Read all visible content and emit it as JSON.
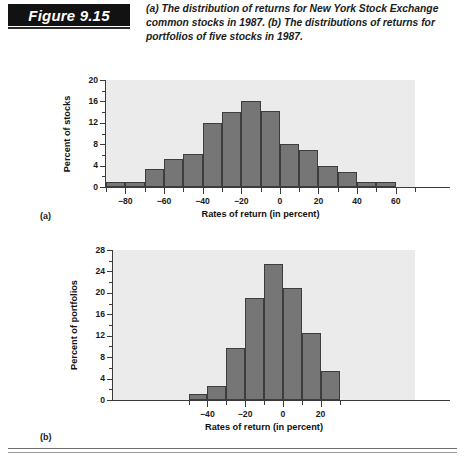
{
  "header": {
    "figure_label": "Figure 9.15",
    "caption": "(a) The distribution of returns for New York Stock Exchange common stocks in 1987. (b) The distributions of returns for portfolios of five stocks in 1987."
  },
  "panels": {
    "a_letter": "(a)",
    "b_letter": "(b)"
  },
  "chart_data": [
    {
      "id": "chart-a",
      "type": "bar",
      "title": "",
      "xlabel": "Rates of return (in percent)",
      "ylabel": "Percent of stocks",
      "xlim": [
        -90,
        70
      ],
      "ylim": [
        0,
        20
      ],
      "bin_width": 10,
      "grid": false,
      "legend": "none",
      "xticks": [
        -90,
        -80,
        -70,
        -60,
        -50,
        -40,
        -30,
        -20,
        -10,
        0,
        10,
        20,
        30,
        40,
        50,
        60,
        70
      ],
      "xtick_labels": [
        "",
        "−80",
        "",
        "−60",
        "",
        "−40",
        "",
        "−20",
        "",
        "0",
        "",
        "20",
        "",
        "40",
        "",
        "60",
        ""
      ],
      "yticks": [
        0,
        2,
        4,
        6,
        8,
        10,
        12,
        14,
        16,
        18,
        20
      ],
      "ytick_labels": [
        "0",
        "",
        "4",
        "",
        "8",
        "",
        "12",
        "",
        "16",
        "",
        "20"
      ],
      "bin_starts": [
        -90,
        -80,
        -70,
        -60,
        -50,
        -40,
        -30,
        -20,
        -10,
        0,
        10,
        20,
        30,
        40,
        50,
        60
      ],
      "categories": [
        "−90 to −80",
        "−80 to −70",
        "−70 to −60",
        "−60 to −50",
        "−50 to −40",
        "−40 to −30",
        "−30 to −20",
        "−20 to −10",
        "−10 to 0",
        "0 to 10",
        "10 to 20",
        "20 to 30",
        "30 to 40",
        "40 to 50",
        "50 to 60",
        "60 to 70"
      ],
      "values": [
        1.0,
        1.0,
        3.4,
        5.2,
        6.1,
        12.0,
        14.0,
        16.0,
        14.2,
        8.0,
        7.0,
        3.9,
        2.8,
        1.0,
        1.0,
        0
      ]
    },
    {
      "id": "chart-b",
      "type": "bar",
      "title": "",
      "xlabel": "Rates of return (in percent)",
      "ylabel": "Percent of portfolios",
      "xlim": [
        -90,
        70
      ],
      "ylim": [
        0,
        28
      ],
      "bin_width": 10,
      "grid": false,
      "legend": "none",
      "xticks": [
        -50,
        -40,
        -30,
        -20,
        -10,
        0,
        10,
        20,
        30
      ],
      "xtick_labels": [
        "",
        "−40",
        "",
        "−20",
        "",
        "0",
        "",
        "20",
        ""
      ],
      "yticks": [
        0,
        2,
        4,
        6,
        8,
        10,
        12,
        14,
        16,
        18,
        20,
        22,
        24,
        26,
        28
      ],
      "ytick_labels": [
        "0",
        "",
        "4",
        "",
        "8",
        "",
        "12",
        "",
        "16",
        "",
        "20",
        "",
        "24",
        "",
        "28"
      ],
      "bin_starts": [
        -50,
        -40,
        -30,
        -20,
        -10,
        0,
        10,
        20
      ],
      "categories": [
        "−50 to −40",
        "−40 to −30",
        "−30 to −20",
        "−20 to −10",
        "−10 to 0",
        "0 to 10",
        "10 to 20",
        "20 to 30"
      ],
      "values": [
        1.2,
        2.7,
        9.8,
        19.0,
        25.3,
        21.0,
        12.5,
        5.4
      ]
    }
  ],
  "colors": {
    "bar_fill": "#767676",
    "bar_stroke": "#3d3d3d",
    "plot_bg": "#ebebeb",
    "axis": "#3a3a3a",
    "badge_bg": "#121212",
    "badge_text": "#ffffff"
  }
}
